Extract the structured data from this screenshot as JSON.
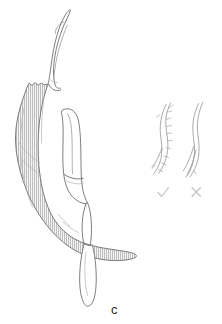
{
  "figure": {
    "panel_label": "c",
    "background_color": "#ffffff",
    "width_px": 222,
    "height_px": 324,
    "caption_text": "c",
    "colors": {
      "outline": "#6e6e6e",
      "outline_soft": "#9a9a9a",
      "hatch_fill": "#b8b8b8",
      "hatch_background": "#f2f2f2",
      "seta_stroke": "#8d8d8d",
      "mark_stroke": "#c2c2c2",
      "label_text": "#2a2a2a"
    }
  },
  "main_structure": {
    "name": "curved-claw-structure",
    "parts": [
      {
        "id": "apical-hook",
        "label": "apical hook",
        "shading": "unshaded",
        "description": "slender curved distal hook, tip recurved to the left"
      },
      {
        "id": "shaded-arm",
        "label": "shaded arm",
        "shading": "vertical-hatched",
        "description": "broad sickle-shaped shaded segment sweeping down and right"
      },
      {
        "id": "inner-segment",
        "label": "inner segment",
        "shading": "unshaded",
        "description": "elongate pale segment lying inside the curve, with a transverse joint line"
      },
      {
        "id": "distal-lobe",
        "label": "distal lobe",
        "shading": "unshaded",
        "description": "narrow terminal lobe projecting downward below the shaded arm"
      }
    ]
  },
  "detail_insets": [
    {
      "id": "seta-barbed",
      "label": "barbed seta",
      "mark": "check",
      "mark_glyph": "✓",
      "description": "sinuous seta bearing short lateral barbs"
    },
    {
      "id": "seta-smooth",
      "label": "smooth seta",
      "mark": "cross",
      "mark_glyph": "✗",
      "description": "sinuous seta without lateral barbs"
    }
  ]
}
